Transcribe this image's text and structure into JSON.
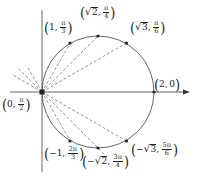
{
  "diagram": {
    "colors": {
      "line": "#444444",
      "dash": "#666666",
      "point": "#222222",
      "background": "#ffffff"
    },
    "axes": {
      "horizontal_arrow": true,
      "vertical_axis": true
    },
    "circle": {
      "center": [
        98,
        92
      ],
      "radius": 56
    },
    "points": [
      {
        "id": "p_origin",
        "r_text": "0",
        "theta_num": "π",
        "theta_den": "2",
        "sqrt": false,
        "neg": false
      },
      {
        "id": "p_1_pi3",
        "r_text": "1",
        "theta_num": "π",
        "theta_den": "3",
        "sqrt": false,
        "neg": false
      },
      {
        "id": "p_sqrt2_pi4",
        "r_text": "2",
        "theta_num": "π",
        "theta_den": "4",
        "sqrt": true,
        "neg": false
      },
      {
        "id": "p_sqrt3_pi6",
        "r_text": "3",
        "theta_num": "π",
        "theta_den": "6",
        "sqrt": true,
        "neg": false
      },
      {
        "id": "p_2_0",
        "r_text": "2",
        "theta_text": "0",
        "sqrt": false,
        "neg": false
      },
      {
        "id": "p_neg1_2pi3",
        "r_text": "1",
        "theta_num": "2π",
        "theta_den": "3",
        "sqrt": false,
        "neg": true
      },
      {
        "id": "p_negsqrt2_3pi4",
        "r_text": "2",
        "theta_num": "3π",
        "theta_den": "4",
        "sqrt": true,
        "neg": true
      },
      {
        "id": "p_negsqrt3_5pi6",
        "r_text": "3",
        "theta_num": "5π",
        "theta_den": "6",
        "sqrt": true,
        "neg": true
      }
    ],
    "symbols": {
      "lparen": "(",
      "rparen": ")",
      "comma": ",",
      "minus": "−",
      "radical": "√"
    }
  }
}
